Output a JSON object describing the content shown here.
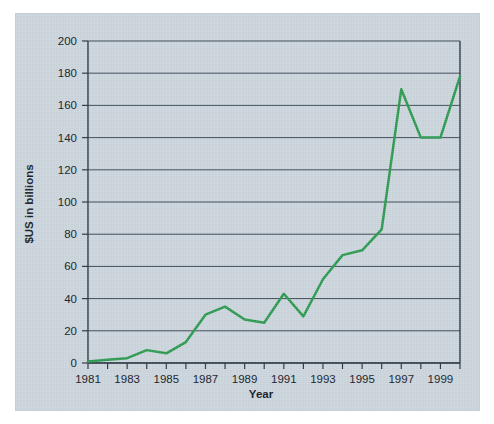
{
  "chart_data": {
    "type": "line",
    "title": "",
    "xlabel": "Year",
    "ylabel": "$US in billions",
    "xlim": [
      1981,
      2000
    ],
    "ylim": [
      0,
      200
    ],
    "ytick_step": 20,
    "yticks": [
      0,
      20,
      40,
      60,
      80,
      100,
      120,
      140,
      160,
      180,
      200
    ],
    "ytick_labels": [
      "0",
      "20",
      "40",
      "60",
      "80",
      "100",
      "120",
      "140",
      "160",
      "180",
      "200"
    ],
    "xticks_major": [
      1981,
      1983,
      1985,
      1987,
      1989,
      1991,
      1993,
      1995,
      1997,
      1999
    ],
    "xtick_labels": [
      "1981",
      "1983",
      "1985",
      "1987",
      "1989",
      "1991",
      "1993",
      "1995",
      "1997",
      "1999"
    ],
    "xticks_minor": [
      1982,
      1984,
      1986,
      1988,
      1990,
      1992,
      1994,
      1996,
      1998,
      2000
    ],
    "grid": "horizontal",
    "legend": "none",
    "series": [
      {
        "name": "$US in billions",
        "color": "#2e9b51",
        "x": [
          1981,
          1982,
          1983,
          1984,
          1985,
          1986,
          1987,
          1988,
          1989,
          1990,
          1991,
          1992,
          1993,
          1994,
          1995,
          1996,
          1997,
          1998,
          1999,
          2000
        ],
        "values": [
          1,
          2,
          3,
          8,
          6,
          13,
          30,
          35,
          27,
          25,
          43,
          29,
          52,
          67,
          70,
          83,
          170,
          140,
          140,
          178
        ]
      }
    ]
  },
  "figure": {
    "background_color": "#ccd6dd",
    "line_color": "#2e9b51",
    "grid_color": "#3c4a57",
    "axis_color": "#2b3742",
    "text_color": "#16202a"
  }
}
